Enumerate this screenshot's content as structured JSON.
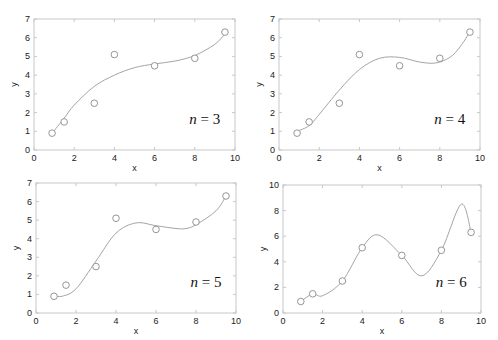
{
  "chart_data": [
    {
      "type": "scatter",
      "title": "",
      "annotation": "n = 3",
      "xlabel": "x",
      "ylabel": "y",
      "xlim": [
        0,
        10
      ],
      "ylim": [
        0,
        7
      ],
      "xticks": [
        0,
        2,
        4,
        6,
        8,
        10
      ],
      "yticks": [
        0,
        1,
        2,
        3,
        4,
        5,
        6,
        7
      ],
      "grid": false,
      "series": [
        {
          "name": "data",
          "marker": "circle",
          "x": [
            0.9,
            1.5,
            3,
            4,
            6,
            8,
            9.5
          ],
          "y": [
            0.9,
            1.5,
            2.5,
            5.1,
            4.5,
            4.9,
            6.3
          ]
        },
        {
          "name": "polyfit degree 3",
          "style": "line",
          "x": [
            0.9,
            1.5,
            2,
            3,
            4,
            5,
            6,
            7,
            8,
            9,
            9.5
          ],
          "y": [
            0.9,
            1.7,
            2.4,
            3.4,
            4.0,
            4.4,
            4.6,
            4.75,
            5.05,
            5.65,
            6.2
          ]
        }
      ],
      "frame": {
        "left": 34,
        "right": 235,
        "top": 19,
        "bottom": 150
      }
    },
    {
      "type": "scatter",
      "title": "",
      "annotation": "n = 4",
      "xlabel": "x",
      "ylabel": "y",
      "xlim": [
        0,
        10
      ],
      "ylim": [
        0,
        7
      ],
      "xticks": [
        0,
        2,
        4,
        6,
        8,
        10
      ],
      "yticks": [
        0,
        1,
        2,
        3,
        4,
        5,
        6,
        7
      ],
      "grid": false,
      "series": [
        {
          "name": "data",
          "marker": "circle",
          "x": [
            0.9,
            1.5,
            3,
            4,
            6,
            8,
            9.5
          ],
          "y": [
            0.9,
            1.5,
            2.5,
            5.1,
            4.5,
            4.9,
            6.3
          ]
        },
        {
          "name": "polyfit degree 4",
          "style": "line",
          "x": [
            0.9,
            1.5,
            2,
            3,
            4,
            5,
            6,
            7,
            7.8,
            8.5,
            9,
            9.5
          ],
          "y": [
            1.0,
            1.3,
            1.9,
            3.2,
            4.3,
            4.9,
            4.95,
            4.7,
            4.65,
            4.95,
            5.5,
            6.3
          ]
        }
      ],
      "frame": {
        "left": 279,
        "right": 480,
        "top": 19,
        "bottom": 150
      }
    },
    {
      "type": "scatter",
      "title": "",
      "annotation": "n = 5",
      "xlabel": "x",
      "ylabel": "y",
      "xlim": [
        0,
        10
      ],
      "ylim": [
        0,
        7
      ],
      "xticks": [
        0,
        2,
        4,
        6,
        8,
        10
      ],
      "yticks": [
        0,
        1,
        2,
        3,
        4,
        5,
        6,
        7
      ],
      "grid": false,
      "series": [
        {
          "name": "data",
          "marker": "circle",
          "x": [
            0.9,
            1.5,
            3,
            4,
            6,
            8,
            9.5
          ],
          "y": [
            0.9,
            1.5,
            2.5,
            5.1,
            4.5,
            4.9,
            6.3
          ]
        },
        {
          "name": "polyfit degree 5",
          "style": "line",
          "x": [
            0.9,
            1.3,
            2,
            3,
            4,
            5,
            6,
            7,
            7.5,
            8,
            9,
            9.5
          ],
          "y": [
            0.95,
            0.9,
            1.3,
            2.8,
            4.3,
            4.85,
            4.7,
            4.55,
            4.55,
            4.75,
            5.5,
            6.3
          ]
        }
      ],
      "frame": {
        "left": 36,
        "right": 236,
        "top": 183,
        "bottom": 313
      }
    },
    {
      "type": "scatter",
      "title": "",
      "annotation": "n = 6",
      "xlabel": "x",
      "ylabel": "y",
      "xlim": [
        0,
        10
      ],
      "ylim": [
        0,
        10
      ],
      "xticks": [
        0,
        2,
        4,
        6,
        8,
        10
      ],
      "yticks": [
        0,
        2,
        4,
        6,
        8,
        10
      ],
      "grid": false,
      "series": [
        {
          "name": "data",
          "marker": "circle",
          "x": [
            0.9,
            1.5,
            3,
            4,
            6,
            8,
            9.5
          ],
          "y": [
            0.9,
            1.5,
            2.5,
            5.1,
            4.5,
            4.9,
            6.3
          ]
        },
        {
          "name": "polyfit degree 6",
          "style": "line",
          "x": [
            0.9,
            1.5,
            2,
            3,
            4,
            4.8,
            6,
            7,
            8,
            9,
            9.5
          ],
          "y": [
            0.9,
            1.5,
            1.35,
            2.5,
            5.1,
            6.1,
            4.5,
            2.9,
            4.9,
            8.5,
            6.3
          ]
        }
      ],
      "frame": {
        "left": 283,
        "right": 481,
        "top": 185,
        "bottom": 313
      }
    }
  ]
}
